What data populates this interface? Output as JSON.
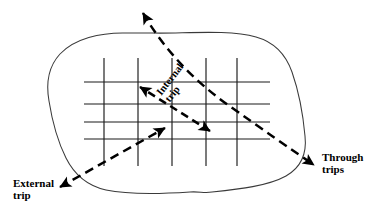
{
  "diagram": {
    "labels": {
      "external_trip": "External\ntrip",
      "through_trips": "Through\ntrips",
      "internal_trip": "Internal\ntrip"
    },
    "colors": {
      "stroke": "#000000",
      "grid": "#1a1a1a",
      "boundary": "#333333",
      "background": "#ffffff"
    },
    "boundary": {
      "name": "study-area-boundary",
      "style": "solid irregular closed curve"
    },
    "grid": {
      "name": "street-grid",
      "vertical_lines": 5,
      "horizontal_lines": 4,
      "vertical_x": [
        104,
        138,
        172,
        206,
        237
      ],
      "vertical_y_range": [
        58,
        166
      ],
      "horizontal_y": [
        82,
        104,
        122,
        139
      ],
      "horizontal_x_range": [
        84,
        270
      ]
    },
    "arrows": [
      {
        "name": "external-trip-arrow",
        "type": "double-headed dashed",
        "from": [
          58,
          188
        ],
        "to": [
          166,
          128
        ]
      },
      {
        "name": "internal-trip-arrow",
        "type": "double-headed dashed",
        "from": [
          211,
          131
        ],
        "to": [
          139,
          86
        ]
      },
      {
        "name": "through-trips-arrow",
        "type": "double-headed dashed curve",
        "from": [
          142,
          12
        ],
        "to": [
          316,
          166
        ]
      }
    ]
  }
}
